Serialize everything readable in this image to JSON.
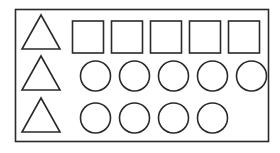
{
  "diagram": {
    "stroke_color": "#2a2a2a",
    "background": "#ffffff",
    "rows": [
      {
        "leading_shape": "triangle",
        "shape": "square",
        "count": 5
      },
      {
        "leading_shape": "triangle",
        "shape": "circle",
        "count": 5
      },
      {
        "leading_shape": "triangle",
        "shape": "circle",
        "count": 4
      }
    ]
  }
}
